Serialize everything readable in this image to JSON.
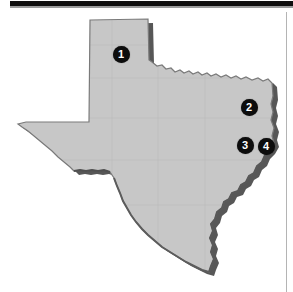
{
  "figure": {
    "map_region": "Texas",
    "background_color": "#ffffff",
    "land_fill_color": "#c8c8c8",
    "land_outline_color": "#6e6e6e",
    "shadow_color": "#3a3a3a",
    "marker_fill_color": "#0d0d0d",
    "marker_label_color": "#ffffff"
  },
  "decorations": {
    "top_bar": {
      "name": "top-scan-bar",
      "color": "#100f0f"
    },
    "right_rule": {
      "name": "right-page-rule",
      "color": "#b4b4b4"
    }
  },
  "markers": [
    {
      "label": "1",
      "x": 121,
      "y": 54,
      "r": 8.5,
      "font_size": 11,
      "region": "panhandle"
    },
    {
      "label": "2",
      "x": 249,
      "y": 107,
      "r": 8.5,
      "font_size": 11,
      "region": "northeast-texas"
    },
    {
      "label": "3",
      "x": 245,
      "y": 145,
      "r": 8.5,
      "font_size": 11,
      "region": "east-texas"
    },
    {
      "label": "4",
      "x": 266,
      "y": 146,
      "r": 8.5,
      "font_size": 11,
      "region": "far-east-texas"
    }
  ]
}
